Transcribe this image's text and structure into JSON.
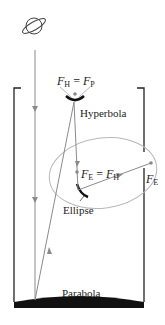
{
  "diagram": {
    "type": "reflecting-telescope-optics",
    "labels": {
      "hyperbola": "Hyperbola",
      "ellipse": "Ellipse",
      "parabola": "Parabola"
    },
    "foci": {
      "top_F": "F",
      "top_sub1": "H",
      "top_eq": " = ",
      "top_F2": "F",
      "top_sub2": "P",
      "mid_F": "F",
      "mid_sub1": "E",
      "mid_eq": " = ",
      "mid_F2": "F",
      "mid_sub2": "H",
      "right_F": "F",
      "right_sub": "E"
    },
    "icons": [
      "planet-icon"
    ],
    "colors": {
      "ray": "#8a8a8a",
      "mirror": "#111111",
      "tube": "#222222",
      "ellipse_outline": "#b8b8b8"
    }
  }
}
